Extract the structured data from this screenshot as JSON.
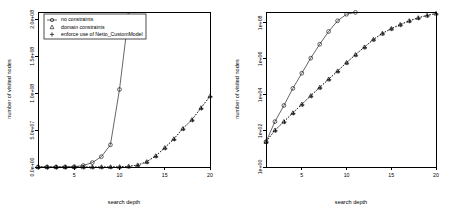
{
  "figure": {
    "background": "#ffffff",
    "foreground": "#000000",
    "panel_count": 2
  },
  "legend": {
    "position": "top-left",
    "entries": [
      {
        "label": "no constraints",
        "marker": "circle-with-line",
        "symbol": "circle"
      },
      {
        "label": "domain constraints",
        "marker": "triangle",
        "symbol": "triangle"
      },
      {
        "label": "enforce use of Netto_CustomModel",
        "marker": "plus",
        "symbol": "plus"
      }
    ]
  },
  "chart_data": [
    {
      "id": "left-panel",
      "type": "line",
      "title": "",
      "xlabel": "search depth",
      "ylabel": "number of visited nodes",
      "xlim": [
        1,
        20
      ],
      "ylim": [
        0,
        210000000
      ],
      "xticks": [
        5,
        10,
        15,
        20
      ],
      "xticklabels": [
        "5",
        "10",
        "15",
        "20"
      ],
      "yticks": [
        0,
        50000000,
        100000000,
        150000000,
        200000000
      ],
      "yticklabels": [
        "0.0e+00",
        "5.0e+07",
        "1.0e+08",
        "1.5e+08",
        "2.0e+08"
      ],
      "yscale": "linear",
      "grid": false,
      "legend_position": "top-left",
      "x": [
        1,
        2,
        3,
        4,
        5,
        6,
        7,
        8,
        9,
        10,
        11
      ],
      "series": [
        {
          "name": "no constraints",
          "symbol": "circle",
          "linestyle": "solid",
          "x": [
            1,
            2,
            3,
            4,
            5,
            6,
            7,
            8,
            9,
            10,
            11
          ],
          "values": [
            20,
            400,
            6000,
            60000,
            400000,
            2000000,
            6000000,
            14000000,
            30000000,
            105000000,
            205000000
          ]
        },
        {
          "name": "domain constraints",
          "symbol": "triangle",
          "linestyle": "dotted",
          "x": [
            1,
            2,
            3,
            4,
            5,
            6,
            7,
            8,
            9,
            10,
            11,
            12,
            13,
            14,
            15,
            16,
            17,
            18,
            19,
            20
          ],
          "values": [
            6,
            30,
            110,
            380,
            1200,
            3600,
            11000,
            33000,
            100000,
            300000,
            900000,
            2600000,
            7000000,
            15000000,
            26000000,
            38000000,
            52000000,
            64000000,
            80000000,
            96000000
          ]
        },
        {
          "name": "enforce use of Netto_CustomModel",
          "symbol": "plus",
          "linestyle": "dotted",
          "x": [
            1,
            2,
            3,
            4,
            5,
            6,
            7,
            8,
            9,
            10,
            11,
            12,
            13,
            14,
            15,
            16,
            17,
            18,
            19,
            20
          ],
          "values": [
            6,
            30,
            110,
            380,
            1200,
            3600,
            11000,
            33000,
            100000,
            300000,
            900000,
            2600000,
            7000000,
            15000000,
            26000000,
            38000000,
            52000000,
            64000000,
            80000000,
            96000000
          ]
        }
      ]
    },
    {
      "id": "right-panel",
      "type": "line",
      "title": "",
      "xlabel": "search depth",
      "ylabel": "number of visited nodes",
      "xlim": [
        1,
        20
      ],
      "ylim": [
        1,
        400000000
      ],
      "xticks": [
        5,
        10,
        15,
        20
      ],
      "xticklabels": [
        "5",
        "10",
        "15",
        "20"
      ],
      "yticks": [
        1,
        100,
        10000,
        1000000,
        100000000
      ],
      "yticklabels": [
        "1e+00",
        "1e+02",
        "1e+04",
        "1e+06",
        "1e+08"
      ],
      "yscale": "log",
      "grid": false,
      "legend_position": "none",
      "series": [
        {
          "name": "no constraints",
          "symbol": "circle",
          "linestyle": "solid",
          "x": [
            1,
            2,
            3,
            4,
            5,
            6,
            7,
            8,
            9,
            10,
            11
          ],
          "values": [
            25,
            330,
            2600,
            23000,
            160000,
            1100000,
            6500000,
            33000000,
            130000000,
            300000000,
            380000000
          ]
        },
        {
          "name": "domain constraints",
          "symbol": "triangle",
          "linestyle": "dotted",
          "x": [
            1,
            2,
            3,
            4,
            5,
            6,
            7,
            8,
            9,
            10,
            11,
            12,
            13,
            14,
            15,
            16,
            17,
            18,
            19,
            20
          ],
          "values": [
            25,
            110,
            330,
            1000,
            3000,
            9000,
            26000,
            75000,
            210000,
            620000,
            1700000,
            4500000,
            12000000,
            26000000,
            48000000,
            80000000,
            130000000,
            190000000,
            260000000,
            330000000
          ]
        },
        {
          "name": "enforce use of Netto_CustomModel",
          "symbol": "plus",
          "linestyle": "dotted",
          "x": [
            1,
            2,
            3,
            4,
            5,
            6,
            7,
            8,
            9,
            10,
            11,
            12,
            13,
            14,
            15,
            16,
            17,
            18,
            19,
            20
          ],
          "values": [
            25,
            110,
            330,
            1000,
            3000,
            9000,
            26000,
            75000,
            210000,
            620000,
            1700000,
            4500000,
            12000000,
            26000000,
            48000000,
            80000000,
            130000000,
            190000000,
            260000000,
            330000000
          ]
        }
      ]
    }
  ]
}
